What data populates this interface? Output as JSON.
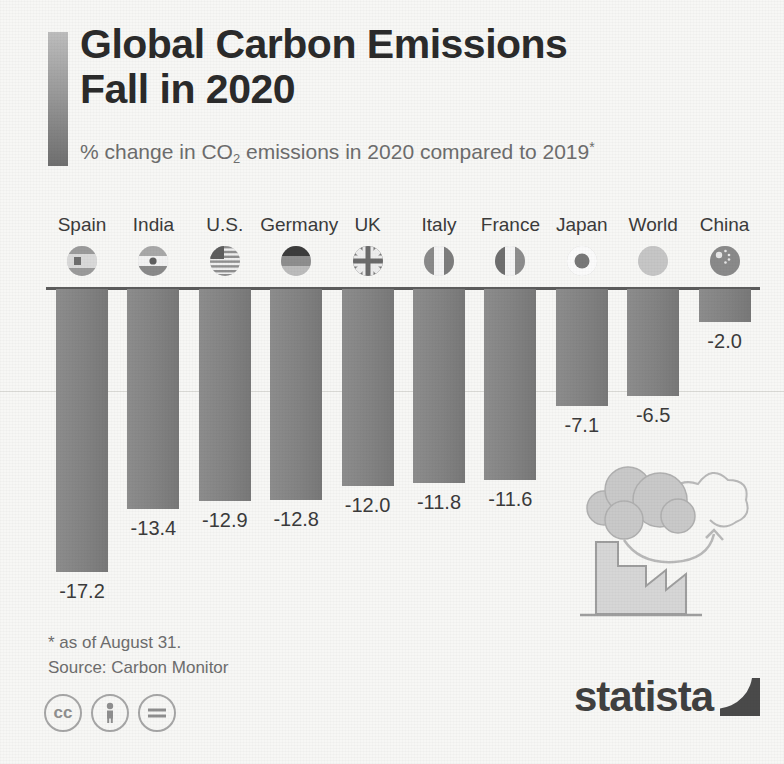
{
  "header": {
    "title_line1": "Global Carbon Emissions",
    "title_line2": "Fall in 2020",
    "subtitle_pre": "% change in CO",
    "subtitle_sub": "2",
    "subtitle_post": " emissions in 2020 compared to 2019",
    "subtitle_star": "*"
  },
  "chart_data": {
    "type": "bar",
    "title": "Global Carbon Emissions Fall in 2020",
    "subtitle": "% change in CO2 emissions in 2020 compared to 2019*",
    "categories": [
      "Spain",
      "India",
      "U.S.",
      "Germany",
      "UK",
      "Italy",
      "France",
      "Japan",
      "World",
      "China"
    ],
    "values": [
      -17.2,
      -13.4,
      -12.9,
      -12.8,
      -12.0,
      -11.8,
      -11.6,
      -7.1,
      -6.5,
      -2.0
    ],
    "value_labels": [
      "-17.2",
      "-13.4",
      "-12.9",
      "-12.8",
      "-12.0",
      "-11.8",
      "-11.6",
      "-7.1",
      "-6.5",
      "-2.0"
    ],
    "flags": [
      "spain-flag-icon",
      "india-flag-icon",
      "us-flag-icon",
      "germany-flag-icon",
      "uk-flag-icon",
      "italy-flag-icon",
      "france-flag-icon",
      "japan-flag-icon",
      "world-globe-icon",
      "china-flag-icon"
    ],
    "xlabel": "",
    "ylabel": "",
    "ylim": [
      -18,
      0
    ],
    "grid": true,
    "legend": "none",
    "orientation": "vertical-downward",
    "bar_color": "#858585",
    "baseline_value": 0
  },
  "footer": {
    "footnote_line1": "* as of August 31.",
    "footnote_line2": "Source: Carbon Monitor",
    "cc_badges": [
      "cc",
      "by",
      "nd"
    ],
    "cc_labels": [
      "cc",
      "\u0001",
      "="
    ],
    "logo_word": "statista"
  },
  "illustration": {
    "name": "factory-emissions-illustration"
  },
  "colors": {
    "background": "#f7f7f5",
    "bar": "#858585",
    "title": "#2b2b2b",
    "subtitle": "#6d6d6d",
    "baseline": "#5c5c5c",
    "gridline": "#dcdcd8",
    "logo": "#404040"
  }
}
